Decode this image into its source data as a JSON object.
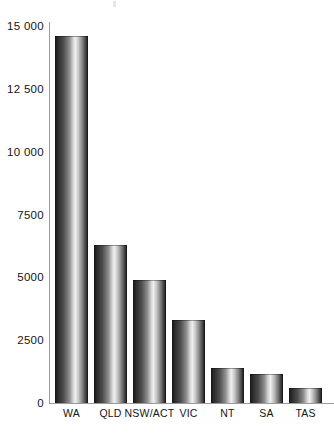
{
  "chart_data": {
    "type": "bar",
    "title": "",
    "subtitle": "",
    "xlabel": "",
    "ylabel": "",
    "categories": [
      "WA",
      "QLD",
      "NSW/ACT",
      "VIC",
      "NT",
      "SA",
      "TAS"
    ],
    "values": [
      14600,
      6300,
      4900,
      3300,
      1400,
      1150,
      600
    ],
    "series": [
      {
        "name": "",
        "values": [
          14600,
          6300,
          4900,
          3300,
          1400,
          1150,
          600
        ]
      }
    ],
    "ylim": [
      0,
      15000
    ],
    "ytick_labels": [
      "0",
      "2500",
      "5000",
      "7500",
      "10 000",
      "12 500",
      "15 000"
    ],
    "ytick_values": [
      0,
      2500,
      5000,
      7500,
      10000,
      12500,
      15000
    ],
    "grid": false,
    "legend": null,
    "legend_position": "none",
    "annotations": [],
    "bar_style": "vertical-metallic-gradient",
    "colors": {
      "axis": "#9b9b9b",
      "text": "#151515",
      "background": "#ffffff",
      "bar_dark": "#151515",
      "bar_light": "#efefef"
    }
  }
}
